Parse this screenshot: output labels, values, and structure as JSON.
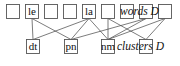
{
  "diagram": {
    "top_row": {
      "caption": "words D",
      "nodes": [
        {
          "id": "w1",
          "label": "",
          "x": 6
        },
        {
          "id": "w2",
          "label": "le",
          "x": 25
        },
        {
          "id": "w3",
          "label": "",
          "x": 44
        },
        {
          "id": "w4",
          "label": "",
          "x": 63
        },
        {
          "id": "w5",
          "label": "la",
          "x": 82
        },
        {
          "id": "w6",
          "label": "",
          "x": 101
        },
        {
          "id": "w7",
          "label": "",
          "x": 120
        },
        {
          "id": "w8",
          "label": "",
          "x": 139
        },
        {
          "id": "w9",
          "label": "",
          "x": 158
        }
      ]
    },
    "bottom_row": {
      "caption": "clusters D",
      "nodes": [
        {
          "id": "c1",
          "label": "dt",
          "x": 26
        },
        {
          "id": "c2",
          "label": "pn",
          "x": 64
        },
        {
          "id": "c3",
          "label": "nm",
          "x": 101
        },
        {
          "id": "c4",
          "label": "",
          "x": 139
        }
      ]
    },
    "edges": [
      [
        "w2",
        "c1"
      ],
      [
        "w2",
        "c2"
      ],
      [
        "w5",
        "c1"
      ],
      [
        "w5",
        "c2"
      ],
      [
        "w5",
        "c3"
      ],
      [
        "w6",
        "c3"
      ],
      [
        "w6",
        "c4"
      ],
      [
        "w8",
        "c2"
      ],
      [
        "w8",
        "c3"
      ],
      [
        "w9",
        "c3"
      ],
      [
        "w9",
        "c4"
      ]
    ]
  }
}
